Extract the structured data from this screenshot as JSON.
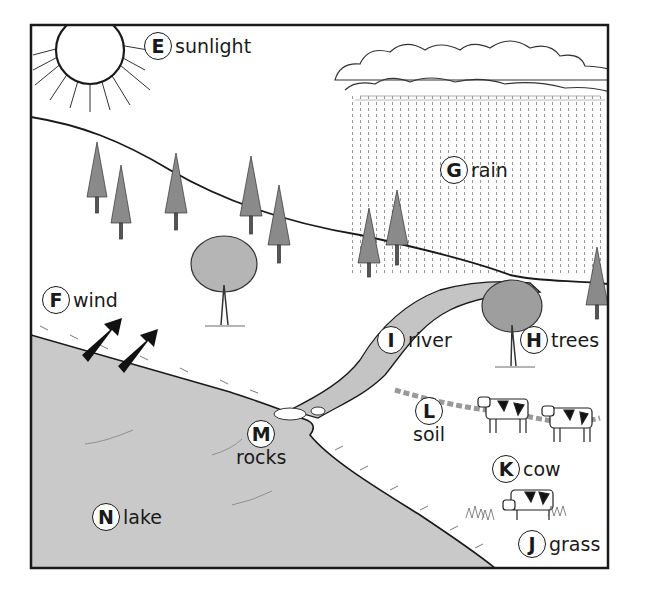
{
  "diagram": {
    "type": "ecosystem-illustration",
    "colors": {
      "frame": "#1a1a1a",
      "lake": "#c9c9c9",
      "river": "#c4c4c4",
      "land": "#ffffff",
      "ink": "#1a1a1a"
    },
    "labels": [
      {
        "letter": "E",
        "text": "sunlight",
        "x": 144,
        "y": 32
      },
      {
        "letter": "F",
        "text": "wind",
        "x": 42,
        "y": 286
      },
      {
        "letter": "G",
        "text": "rain",
        "x": 440,
        "y": 156
      },
      {
        "letter": "H",
        "text": "trees",
        "x": 520,
        "y": 326
      },
      {
        "letter": "I",
        "text": "river",
        "x": 377,
        "y": 326
      },
      {
        "letter": "L",
        "text": "soil",
        "x": 413,
        "y": 397,
        "stacked": true
      },
      {
        "letter": "K",
        "text": "cow",
        "x": 492,
        "y": 455
      },
      {
        "letter": "J",
        "text": "grass",
        "x": 518,
        "y": 530
      },
      {
        "letter": "M",
        "text": "rocks",
        "x": 236,
        "y": 420,
        "stacked": true
      },
      {
        "letter": "N",
        "text": "lake",
        "x": 92,
        "y": 503
      }
    ]
  }
}
